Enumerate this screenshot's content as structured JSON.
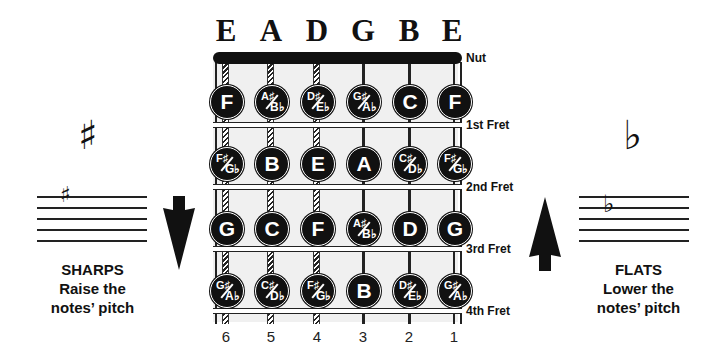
{
  "strings": {
    "names": [
      "E",
      "A",
      "D",
      "G",
      "B",
      "E"
    ],
    "numbers": [
      "6",
      "5",
      "4",
      "3",
      "2",
      "1"
    ]
  },
  "nut_label": "Nut",
  "frets": [
    {
      "label": "1st Fret",
      "notes": [
        {
          "main": "F"
        },
        {
          "top": "A♯",
          "bottom": "B♭"
        },
        {
          "top": "D♯",
          "bottom": "E♭"
        },
        {
          "top": "G♯",
          "bottom": "A♭"
        },
        {
          "main": "C"
        },
        {
          "main": "F"
        }
      ]
    },
    {
      "label": "2nd Fret",
      "notes": [
        {
          "top": "F♯",
          "bottom": "G♭"
        },
        {
          "main": "B"
        },
        {
          "main": "E"
        },
        {
          "main": "A"
        },
        {
          "top": "C♯",
          "bottom": "D♭"
        },
        {
          "top": "F♯",
          "bottom": "G♭"
        }
      ]
    },
    {
      "label": "3rd Fret",
      "notes": [
        {
          "main": "G"
        },
        {
          "main": "C"
        },
        {
          "main": "F"
        },
        {
          "top": "A♯",
          "bottom": "B♭"
        },
        {
          "main": "D"
        },
        {
          "main": "G"
        }
      ]
    },
    {
      "label": "4th Fret",
      "notes": [
        {
          "top": "G♯",
          "bottom": "A♭"
        },
        {
          "top": "C♯",
          "bottom": "D♭"
        },
        {
          "top": "F♯",
          "bottom": "G♭"
        },
        {
          "main": "B"
        },
        {
          "top": "D♯",
          "bottom": "E♭"
        },
        {
          "top": "G♯",
          "bottom": "A♭"
        }
      ]
    }
  ],
  "sharps": {
    "symbol": "♯",
    "staff_symbol": "♯",
    "title": "SHARPS",
    "line1": "Raise the",
    "line2": "notes’ pitch",
    "arrow": "arrow-down"
  },
  "flats": {
    "symbol": "♭",
    "staff_symbol": "♭",
    "title": "FLATS",
    "line1": "Lower the",
    "line2": "notes’ pitch",
    "arrow": "arrow-up"
  }
}
